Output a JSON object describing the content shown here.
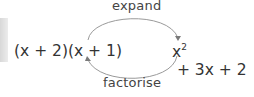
{
  "labels": {
    "top": "expand",
    "bottom": "factorise"
  },
  "expressions": {
    "factorised": "(x + 2)(x + 1)",
    "expanded_base": "x",
    "expanded_exponent": "2",
    "expanded_rest": " + 3x + 2"
  },
  "arrows": {
    "top": "arrow from factorised form to expanded form",
    "bottom": "arrow from expanded form to factorised form"
  }
}
